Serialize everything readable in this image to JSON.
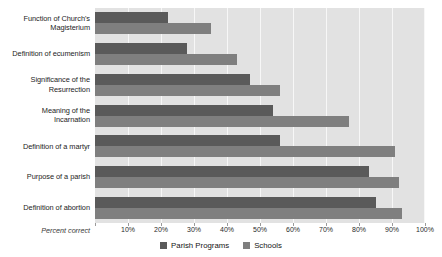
{
  "chart_data": {
    "type": "bar",
    "orientation": "horizontal",
    "title": "",
    "subtitle": "",
    "xlabel": "Percent correct",
    "ylabel": "",
    "xlim": [
      0,
      100
    ],
    "xticks": [
      0,
      10,
      20,
      30,
      40,
      50,
      60,
      70,
      80,
      90,
      100
    ],
    "xtick_labels": [
      "",
      "10%",
      "20%",
      "30%",
      "40%",
      "50%",
      "60%",
      "70%",
      "80%",
      "90%",
      "100%"
    ],
    "grid": true,
    "legend_position": "bottom-center",
    "categories": [
      "Function of Church's Magisterium",
      "Definition of ecumenism",
      "Significance of the Resurrection",
      "Meaning of the Incarnation",
      "Definition of a martyr",
      "Purpose of a parish",
      "Definition of abortion"
    ],
    "category_lines": [
      [
        "Function of Church's",
        "Magisterium"
      ],
      [
        "Definition of ecumenism"
      ],
      [
        "Significance of the",
        "Resurrection"
      ],
      [
        "Meaning of the",
        "Incarnation"
      ],
      [
        "Definition of a martyr"
      ],
      [
        "Purpose of a parish"
      ],
      [
        "Definition of abortion"
      ]
    ],
    "series": [
      {
        "name": "Parish Programs",
        "color": "#5a5a5a",
        "values": [
          22,
          28,
          47,
          54,
          56,
          83,
          85
        ]
      },
      {
        "name": "Schools",
        "color": "#7f7f7f",
        "values": [
          35,
          43,
          56,
          77,
          91,
          92,
          93
        ]
      }
    ]
  },
  "axis": {
    "caption": "Percent correct"
  },
  "colors": {
    "plot_background": "#e2e2e2",
    "gridline": "#f7f7f7",
    "page_background": "#ffffff",
    "series_parish": "#5a5a5a",
    "series_schools": "#7f7f7f"
  }
}
